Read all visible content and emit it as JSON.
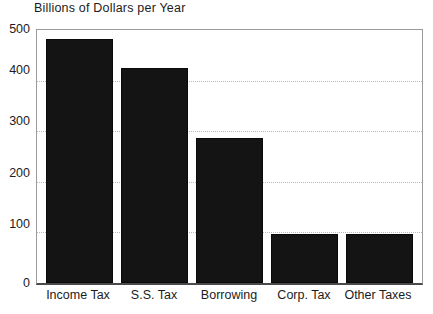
{
  "chart_data": {
    "type": "bar",
    "title": "Billions of Dollars per Year",
    "xlabel": "",
    "ylabel": "",
    "categories": [
      "Income Tax",
      "S.S. Tax",
      "Borrowing",
      "Corp. Tax",
      "Other Taxes"
    ],
    "values": [
      482,
      424,
      287,
      96,
      96
    ],
    "ylim": [
      0,
      500
    ],
    "yticks": [
      0,
      100,
      200,
      300,
      400,
      500
    ],
    "ytick_labels": [
      "0",
      "100",
      "200",
      "300",
      "400",
      "500"
    ],
    "grid": true,
    "grid_style": "dotted",
    "legend": "none",
    "bar_color": "#141414",
    "background_color": "#ffffff",
    "axis_color": "#4a4a4a",
    "grid_color": "#b9b9b9",
    "text_color": "#1c1c1c"
  }
}
